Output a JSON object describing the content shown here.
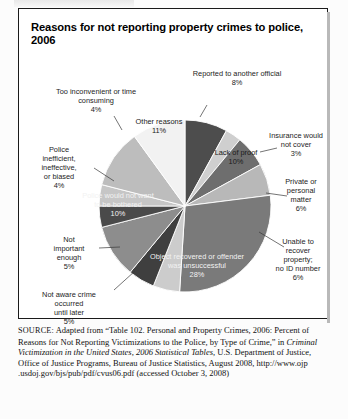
{
  "figure": {
    "title": "Reasons for not reporting property crimes to police, 2006"
  },
  "source": {
    "label": "SOURCE:",
    "part1": " Adapted from “Table 102. Personal and Property Crimes, 2006: Percent of Reasons for Not Reporting Victimizations to the Police, by Type of Crime,” in ",
    "italic1": "Criminal Victimization in the United States, 2006 Statistical Tables",
    "part2": ", U.S. Department of Justice, Office of Justice Programs, Bureau of Justice Statistics, August 2008, http://www.ojp .usdoj.gov/bjs/pub/pdf/cvus06.pdf (accessed October 3, 2008)"
  },
  "chart_data": {
    "type": "pie",
    "title": "Reasons for not reporting property crimes to police, 2006",
    "unit": "percent",
    "legend": "none",
    "labels_on_slices": true,
    "categories": [
      "Reported to another official",
      "Insurance would not cover",
      "Private or personal matter",
      "Unable to recover property; no ID number",
      "Object recovered or offender was unsuccessful",
      "Not aware crime occurred until later",
      "Not important enough",
      "Police would not want to be bothered",
      "Police inefficient, ineffective, or biased",
      "Too inconvenient or time consuming",
      "Other reasons",
      "Lack of proof"
    ],
    "values": [
      8,
      3,
      6,
      6,
      28,
      5,
      5,
      10,
      4,
      4,
      11,
      10
    ],
    "colors": [
      "#4d4d4d",
      "#cfcfcf",
      "#6e6e6e",
      "#b8b8b8",
      "#7a7a7a",
      "#cccccc",
      "#3f3f3f",
      "#8d8d8d",
      "#4a4a4a",
      "#c6c6c6",
      "#bdbdbd",
      "#f2f2f2"
    ],
    "slices": [
      {
        "label": "Reported to another official",
        "value": 8,
        "value_text": "8%",
        "label_position": "outside-top",
        "color": "#4d4d4d"
      },
      {
        "label": "Insurance would not cover",
        "value": 3,
        "value_text": "3%",
        "label_position": "outside-right",
        "color": "#cfcfcf"
      },
      {
        "label": "Private or personal matter",
        "value": 6,
        "value_text": "6%",
        "label_position": "outside-right",
        "color": "#6e6e6e"
      },
      {
        "label": "Unable to recover property; no ID number",
        "value": 6,
        "value_text": "6%",
        "label_position": "outside-right",
        "color": "#b8b8b8"
      },
      {
        "label": "Object recovered or offender was unsuccessful",
        "value": 28,
        "value_text": "28%",
        "label_position": "inside-bottom",
        "color": "#7a7a7a"
      },
      {
        "label": "Not aware crime occurred until later",
        "value": 5,
        "value_text": "5%",
        "label_position": "outside-left",
        "color": "#cccccc"
      },
      {
        "label": "Not important enough",
        "value": 5,
        "value_text": "5%",
        "label_position": "outside-left",
        "color": "#3f3f3f"
      },
      {
        "label": "Police would not want to be bothered",
        "value": 10,
        "value_text": "10%",
        "label_position": "inside-left",
        "color": "#8d8d8d"
      },
      {
        "label": "Police inefficient, ineffective, or biased",
        "value": 4,
        "value_text": "4%",
        "label_position": "outside-left",
        "color": "#4a4a4a"
      },
      {
        "label": "Too inconvenient or time consuming",
        "value": 4,
        "value_text": "4%",
        "label_position": "outside-top-left",
        "color": "#c6c6c6"
      },
      {
        "label": "Other reasons",
        "value": 11,
        "value_text": "11%",
        "label_position": "inside-top-left",
        "color": "#bdbdbd"
      },
      {
        "label": "Lack of proof",
        "value": 10,
        "value_text": "10%",
        "label_position": "inside-right",
        "color": "#f2f2f2"
      }
    ]
  },
  "labels": {
    "reported_official": "Reported to another official\n8%",
    "insurance": "Insurance would\nnot cover\n3%",
    "private": "Private or\npersonal\nmatter\n6%",
    "unable_recover": "Unable to\nrecover\nproperty;\nno ID number\n6%",
    "object_recovered": "Object recovered or offender\nwas unsuccessful\n28%",
    "not_aware": "Not aware crime\noccurred\nuntil later\n5%",
    "not_important": "Not\nimportant\nenough\n5%",
    "police_bothered": "Police would not want\nto be bothered\n10%",
    "police_inefficient": "Police\ninefficient,\nineffective,\nor biased\n4%",
    "too_inconvenient": "Too inconvenient or time\nconsuming\n4%",
    "other_reasons": "Other reasons\n11%",
    "lack_of_proof": "Lack of proof\n10%"
  }
}
